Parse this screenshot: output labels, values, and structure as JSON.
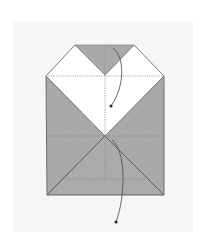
{
  "diagram": {
    "type": "origami-fold-step",
    "colors": {
      "background": "#ffffff",
      "panel": "#f6f6f6",
      "paper_gray": "#a9a9a9",
      "paper_white": "#ffffff",
      "edge": "#6e6e6e",
      "fold_line": "#888888",
      "arrow": "#555555"
    },
    "shapes": {
      "top_triangle": "75,45 134,45 105,75",
      "white_region": "75,45 105,75 134,45 164,76 105,136 46,76",
      "left_gray": "46,76 105,136 47,195",
      "right_gray": "164,76 105,136 164,195",
      "bottom_gray": "47,195 105,136 164,195"
    },
    "fold_lines": [
      {
        "x1": 46,
        "y1": 76,
        "x2": 164,
        "y2": 76,
        "style": "dotted"
      },
      {
        "x1": 47,
        "y1": 136,
        "x2": 164,
        "y2": 136,
        "style": "dashed"
      },
      {
        "x1": 65,
        "y1": 179,
        "x2": 145,
        "y2": 179,
        "style": "dotted"
      },
      {
        "x1": 105,
        "y1": 47,
        "x2": 105,
        "y2": 185,
        "style": "dotted"
      }
    ],
    "arrows": [
      {
        "name": "upper-fold-arrow",
        "path": "M113,48 C124,55 126,85 111,106",
        "end": [
          111,
          106
        ]
      },
      {
        "name": "lower-fold-arrow",
        "path": "M112,140 C126,150 126,195 116,222",
        "end": [
          116,
          222
        ]
      }
    ]
  }
}
